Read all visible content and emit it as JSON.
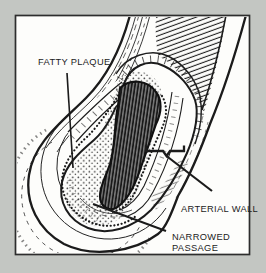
{
  "diagram": {
    "labels": {
      "fatty_plaque": "FATTY PLAQUE",
      "arterial_wall": "ARTERIAL WALL",
      "narrowed_passage_line1": "NARROWED",
      "narrowed_passage_line2": "PASSAGE"
    },
    "colors": {
      "frame_background": "#c3c6c2",
      "panel_background": "#fdfdfb",
      "panel_border": "#2d2d2d",
      "ink": "#1b1b1b"
    }
  }
}
